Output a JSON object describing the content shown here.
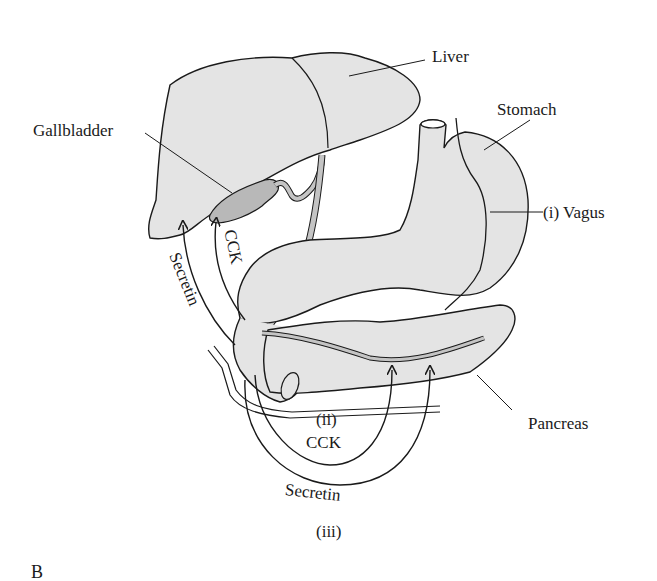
{
  "figure": {
    "panel_label": "B",
    "labels": {
      "liver": "Liver",
      "stomach": "Stomach",
      "gallbladder": "Gallbladder",
      "vagus": "(i)  Vagus",
      "pancreas": "Pancreas",
      "secretin_left": "Secretin",
      "cck_left": "CCK",
      "ii": "(ii)",
      "cck_bottom": "CCK",
      "secretin_bottom": "Secretin",
      "iii": "(iii)"
    },
    "colors": {
      "organ_fill": "#e4e4e4",
      "gallbladder_fill": "#b8b8b8",
      "duct_fill": "#c4c4c4",
      "stroke": "#1a1a1a"
    }
  }
}
